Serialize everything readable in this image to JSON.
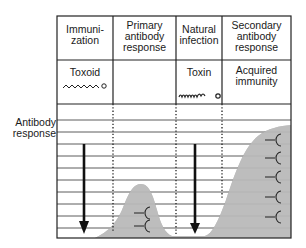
{
  "diagram": {
    "y_axis_label": [
      "Antibody",
      "response"
    ],
    "columns": [
      {
        "header": [
          "Immuni-",
          "zation"
        ],
        "agent_label": "Toxoid",
        "agent_icon": "toxoid-chain-icon"
      },
      {
        "header": [
          "Primary",
          "antibody",
          "response"
        ],
        "agent_label": "",
        "agent_icon": ""
      },
      {
        "header": [
          "Natural",
          "infection"
        ],
        "agent_label": "Toxin",
        "agent_icon": "toxin-chain-icon"
      },
      {
        "header": [
          "Secondary",
          "antibody",
          "response"
        ],
        "agent_label": [
          "Acquired",
          "immunity"
        ],
        "agent_icon": ""
      }
    ],
    "antibody_icons": {
      "primary_count": 2,
      "secondary_count": 5,
      "name": "antibody-y-icon"
    },
    "arrows": [
      "immunization-arrow",
      "infection-arrow"
    ],
    "colors": {
      "fill": "#bdbdbd",
      "line": "#222222",
      "grid": "#333333"
    }
  }
}
